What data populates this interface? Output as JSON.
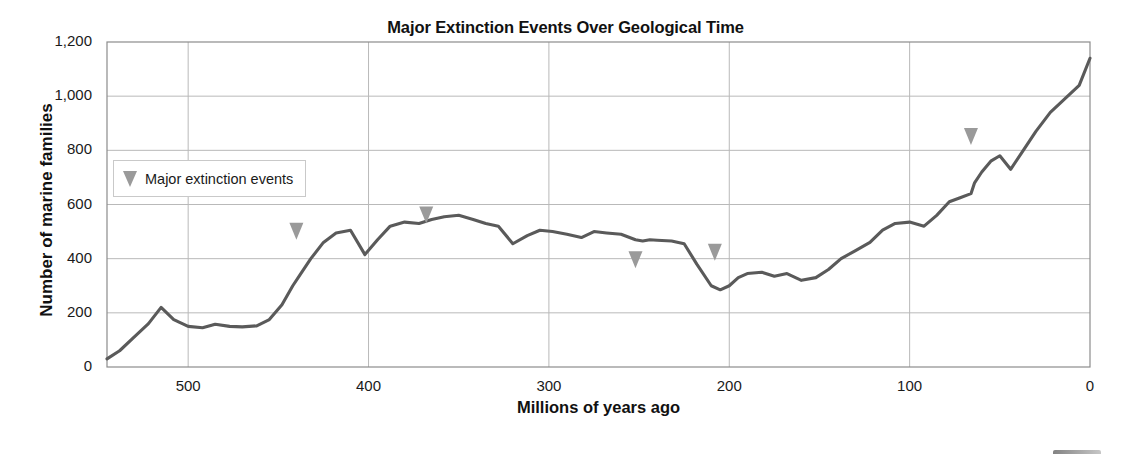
{
  "chart_data": {
    "type": "line",
    "title": "Major Extinction Events Over Geological Time",
    "xlabel": "Millions of years ago",
    "ylabel": "Number of marine families",
    "xlim": [
      545,
      0
    ],
    "ylim": [
      0,
      1200
    ],
    "x_inverted": true,
    "grid": true,
    "xticks": [
      500,
      400,
      300,
      200,
      100,
      0
    ],
    "xtick_labels": [
      "500",
      "400",
      "300",
      "200",
      "100",
      "0"
    ],
    "yticks": [
      0,
      200,
      400,
      600,
      800,
      1000,
      1200
    ],
    "ytick_labels": [
      "0",
      "200",
      "400",
      "600",
      "800",
      "1,000",
      "1,200"
    ],
    "legend": {
      "position": "upper-left-inside",
      "entries": [
        {
          "label": "Major extinction events",
          "marker": "triangle-down",
          "color": "#9a9a9a"
        }
      ]
    },
    "series": [
      {
        "name": "Number of marine families",
        "color": "#5a5a5a",
        "x": [
          545,
          538,
          530,
          522,
          515,
          508,
          500,
          492,
          485,
          477,
          470,
          462,
          455,
          448,
          442,
          438,
          432,
          425,
          418,
          410,
          402,
          395,
          388,
          380,
          372,
          365,
          358,
          350,
          342,
          335,
          328,
          320,
          312,
          305,
          298,
          290,
          282,
          275,
          268,
          260,
          252,
          248,
          244,
          240,
          232,
          225,
          218,
          210,
          205,
          200,
          195,
          190,
          182,
          175,
          168,
          160,
          152,
          145,
          138,
          130,
          122,
          115,
          108,
          100,
          92,
          85,
          78,
          72,
          66,
          64,
          60,
          55,
          50,
          44,
          38,
          30,
          22,
          14,
          6,
          0
        ],
        "y": [
          30,
          60,
          110,
          160,
          220,
          175,
          150,
          145,
          158,
          150,
          148,
          152,
          175,
          230,
          300,
          340,
          400,
          460,
          495,
          505,
          415,
          470,
          520,
          535,
          530,
          545,
          555,
          560,
          545,
          530,
          520,
          455,
          485,
          505,
          500,
          490,
          478,
          500,
          495,
          490,
          470,
          465,
          470,
          468,
          465,
          455,
          380,
          300,
          285,
          300,
          330,
          345,
          350,
          335,
          345,
          320,
          330,
          360,
          400,
          430,
          460,
          505,
          530,
          535,
          520,
          560,
          610,
          625,
          640,
          680,
          720,
          760,
          780,
          730,
          790,
          870,
          940,
          990,
          1040,
          1140
        ]
      }
    ],
    "annotations": [
      {
        "label": "end-Ordovician",
        "x": 440,
        "y": 470,
        "marker": "triangle-down"
      },
      {
        "label": "late Devonian",
        "x": 368,
        "y": 530,
        "marker": "triangle-down"
      },
      {
        "label": "end-Permian",
        "x": 252,
        "y": 365,
        "marker": "triangle-down"
      },
      {
        "label": "end-Triassic",
        "x": 208,
        "y": 392,
        "marker": "triangle-down"
      },
      {
        "label": "end-Cretaceous",
        "x": 66,
        "y": 820,
        "marker": "triangle-down"
      }
    ]
  },
  "legend": {
    "label": "Major extinction events"
  }
}
